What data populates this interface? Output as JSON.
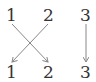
{
  "diagram": {
    "type": "permutation",
    "top_labels": [
      "1",
      "2",
      "3"
    ],
    "bottom_labels": [
      "1",
      "2",
      "3"
    ],
    "mapping": [
      {
        "from": "1",
        "to": "2"
      },
      {
        "from": "2",
        "to": "1"
      },
      {
        "from": "3",
        "to": "3"
      }
    ],
    "colors": {
      "text": "#333333",
      "arrow": "#888888"
    }
  }
}
